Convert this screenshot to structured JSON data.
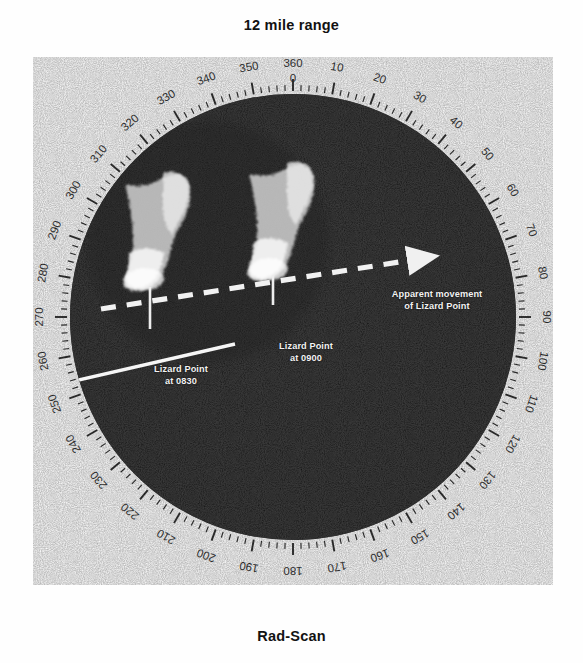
{
  "header": {
    "title": "12 mile range"
  },
  "footer": {
    "title": "Rad-Scan"
  },
  "display": {
    "type": "radar-ppi-scope",
    "scope_color": "#101010",
    "bezel_color": "#ffffff",
    "trace_color": "#e8e8e8",
    "center_deg": 0,
    "bearing_scale": {
      "units": "degrees",
      "minor_tick_interval": 2,
      "major_tick_interval": 10,
      "label_interval": 10,
      "labels": [
        "360",
        "10",
        "20",
        "30",
        "40",
        "50",
        "60",
        "70",
        "80",
        "90",
        "100",
        "110",
        "120",
        "130",
        "140",
        "150",
        "160",
        "170",
        "180",
        "190",
        "200",
        "210",
        "220",
        "230",
        "240",
        "250",
        "260",
        "270",
        "280",
        "290",
        "300",
        "310",
        "320",
        "330",
        "340",
        "350"
      ],
      "zero_label": "0"
    },
    "heading_marker": {
      "name": "heading-line",
      "bearing_deg": 262,
      "style": "solid-white"
    }
  },
  "annotations": {
    "movement": {
      "line1": "Apparent movement",
      "line2": "of Lizard Point"
    },
    "target_1": {
      "line1": "Lizard Point",
      "line2": "at 0830",
      "bearing_deg": 318,
      "time": "0830"
    },
    "target_2": {
      "line1": "Lizard Point",
      "line2": "at 0900",
      "bearing_deg": 333,
      "time": "0900"
    },
    "movement_arrow": {
      "style": "dashed",
      "direction": "left-to-right-ascending"
    }
  },
  "chart_data": {
    "type": "scatter",
    "title": "12 mile range",
    "subtitle": "Rad-Scan",
    "plot_kind": "polar-radar-ppi",
    "range_nm": 12,
    "axis": {
      "angular_units": "degrees",
      "angular_range": [
        0,
        360
      ],
      "angular_zero_at": "top",
      "angular_direction": "clockwise",
      "tick_labels": [
        "360",
        "10",
        "20",
        "30",
        "40",
        "50",
        "60",
        "70",
        "80",
        "90",
        "100",
        "110",
        "120",
        "130",
        "140",
        "150",
        "160",
        "170",
        "180",
        "190",
        "200",
        "210",
        "220",
        "230",
        "240",
        "250",
        "260",
        "270",
        "280",
        "290",
        "300",
        "310",
        "320",
        "330",
        "340",
        "350"
      ],
      "radial_range": [
        0,
        12
      ],
      "grid": false,
      "legend": "none"
    },
    "series": [
      {
        "name": "Lizard Point at 0830",
        "bearing_deg": 318,
        "range_nm": 6.5,
        "label": "Lizard Point at 0830"
      },
      {
        "name": "Lizard Point at 0900",
        "bearing_deg": 333,
        "range_nm": 6.0,
        "label": "Lizard Point at 0900"
      }
    ],
    "annotations": [
      {
        "text": "Apparent movement of Lizard Point",
        "type": "arrow",
        "style": "dashed"
      },
      {
        "text": "Lizard Point at 0830",
        "type": "callout"
      },
      {
        "text": "Lizard Point at 0900",
        "type": "callout"
      }
    ]
  }
}
